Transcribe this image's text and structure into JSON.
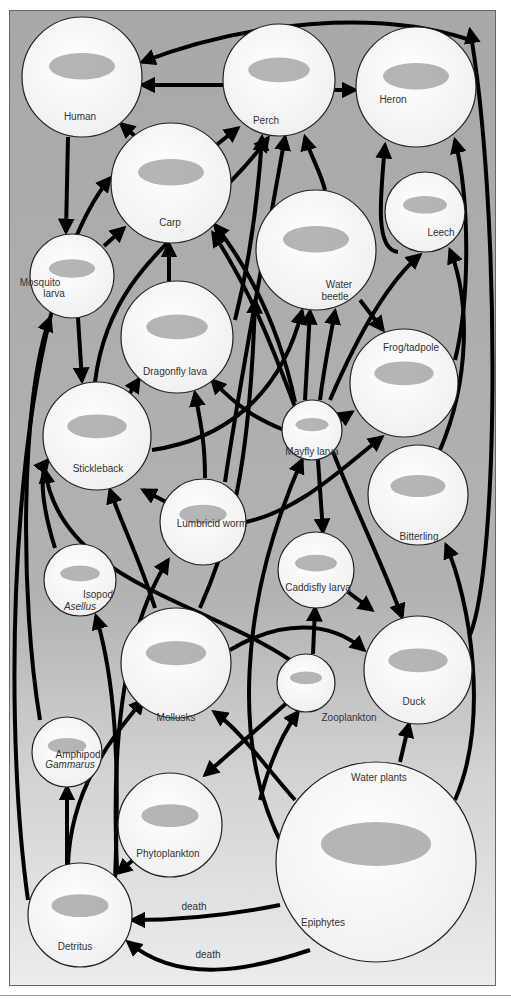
{
  "diagram": {
    "type": "food-web",
    "panel": {
      "x": 9,
      "y": 10,
      "w": 486,
      "h": 975,
      "color_top": "#a8a8a8",
      "color_bottom": "#ececec",
      "border": "#666666"
    },
    "nodes": [
      {
        "id": "human",
        "label": "Human",
        "cx": 82,
        "cy": 77,
        "r": 60,
        "lx": 80,
        "ly": 120
      },
      {
        "id": "perch",
        "label": "Perch",
        "cx": 279,
        "cy": 80,
        "r": 56,
        "lx": 266,
        "ly": 124
      },
      {
        "id": "heron",
        "label": "Heron",
        "cx": 416,
        "cy": 87,
        "r": 60,
        "lx": 393,
        "ly": 103
      },
      {
        "id": "carp",
        "label": "Carp",
        "cx": 171,
        "cy": 183,
        "r": 60,
        "lx": 170,
        "ly": 226
      },
      {
        "id": "leech",
        "label": "Leech",
        "cx": 425,
        "cy": 212,
        "r": 40,
        "lx": 441,
        "ly": 236
      },
      {
        "id": "water-beetle",
        "label": "Water",
        "label2": "beetle",
        "cx": 316,
        "cy": 250,
        "r": 60,
        "lx": 339,
        "ly": 288,
        "lx2": 335,
        "ly2": 300
      },
      {
        "id": "mosquito-larva",
        "label": "Mosquito",
        "label2": "larva",
        "cx": 72,
        "cy": 276,
        "r": 42,
        "lx": 40,
        "ly": 286,
        "lx2": 54,
        "ly2": 297
      },
      {
        "id": "dragonfly-larva",
        "label": "Dragonfly lava",
        "cx": 177,
        "cy": 337,
        "r": 56,
        "lx": 175,
        "ly": 375
      },
      {
        "id": "frog-tadpole",
        "label": "Frog/tadpole",
        "cx": 404,
        "cy": 383,
        "r": 54,
        "lx": 411,
        "ly": 351
      },
      {
        "id": "stickleback",
        "label": "Stickleback",
        "cx": 97,
        "cy": 436,
        "r": 54,
        "lx": 98,
        "ly": 472
      },
      {
        "id": "mayfly-larva",
        "label": "Mayfly larva",
        "cx": 312,
        "cy": 430,
        "r": 30,
        "lx": 312,
        "ly": 455
      },
      {
        "id": "lumbricid-worm",
        "label": "Lumbricid worm",
        "cx": 203,
        "cy": 522,
        "r": 43,
        "lx": 212,
        "ly": 527
      },
      {
        "id": "bitterling",
        "label": "Bitterling",
        "cx": 418,
        "cy": 495,
        "r": 50,
        "lx": 419,
        "ly": 540
      },
      {
        "id": "isopod-asellus",
        "label": "Isopod",
        "label2": "Asellus",
        "cx": 80,
        "cy": 580,
        "r": 36,
        "lx": 98,
        "ly": 598,
        "lx2": 80,
        "ly2": 610,
        "italic2": true
      },
      {
        "id": "caddisfly-larva",
        "label": "Caddisfly larva",
        "cx": 316,
        "cy": 570,
        "r": 38,
        "lx": 318,
        "ly": 591
      },
      {
        "id": "mollusks",
        "label": "Mollusks",
        "cx": 176,
        "cy": 663,
        "r": 55,
        "lx": 176,
        "ly": 721
      },
      {
        "id": "zooplankton",
        "label": "Zooplankton",
        "cx": 306,
        "cy": 683,
        "r": 29,
        "lx": 349,
        "ly": 721
      },
      {
        "id": "duck",
        "label": "Duck",
        "cx": 418,
        "cy": 670,
        "r": 54,
        "lx": 414,
        "ly": 705
      },
      {
        "id": "amphipod-gammarus",
        "label": "Amphipod",
        "label2": "Gammarus",
        "cx": 67,
        "cy": 752,
        "r": 35,
        "lx": 78,
        "ly": 758,
        "lx2": 70,
        "ly2": 768,
        "italic2": true
      },
      {
        "id": "phytoplankton",
        "label": "Phytoplankton",
        "cx": 170,
        "cy": 825,
        "r": 52,
        "lx": 168,
        "ly": 857
      },
      {
        "id": "water-plants",
        "label": "Water plants",
        "label2": "Epiphytes",
        "cx": 376,
        "cy": 862,
        "r": 100,
        "lx": 379,
        "ly": 781,
        "lx2": 323,
        "ly2": 926
      },
      {
        "id": "detritus",
        "label": "Detritus",
        "cx": 80,
        "cy": 915,
        "r": 52,
        "lx": 75,
        "ly": 950
      }
    ],
    "edges": [
      {
        "from": "perch",
        "to": "human",
        "d": "M223 85 L142 85"
      },
      {
        "from": "heron",
        "to": "human",
        "d": "M470 40 C380 10 250 20 142 62"
      },
      {
        "from": "carp",
        "to": "human",
        "d": "M135 136 L121 124"
      },
      {
        "from": "carp",
        "to": "perch",
        "d": "M215 146 L238 128"
      },
      {
        "from": "perch",
        "to": "heron",
        "d": "M333 90 L355 90"
      },
      {
        "from": "human",
        "to": "mosquito-larva",
        "d": "M68 137 L66 232"
      },
      {
        "from": "mosquito-larva",
        "to": "carp",
        "d": "M104 246 L124 228"
      },
      {
        "from": "mosquito-larva",
        "to": "stickleback",
        "d": "M78 318 L82 381"
      },
      {
        "from": "dragonfly-larva",
        "to": "carp",
        "d": "M169 281 L169 244"
      },
      {
        "from": "water-beetle",
        "to": "perch",
        "d": "M325 190 C320 170 310 155 305 137"
      },
      {
        "from": "dragonfly-larva",
        "to": "perch",
        "d": "M235 320 C250 260 258 200 262 137"
      },
      {
        "from": "stickleback",
        "to": "perch",
        "d": "M95 382 C110 260 200 230 268 138"
      },
      {
        "from": "leech",
        "to": "heron",
        "d": "M398 252 C375 250 380 200 385 145"
      },
      {
        "from": "frog-tadpole",
        "to": "heron",
        "d": "M455 360 C470 300 470 200 455 140"
      },
      {
        "from": "duck",
        "to": "heron",
        "d": "M470 635 C500 560 500 200 470 30"
      },
      {
        "from": "stickleback",
        "to": "dragonfly-larva",
        "d": "M130 393 L139 379"
      },
      {
        "from": "stickleback",
        "to": "water-beetle",
        "d": "M152 450 C220 440 280 400 302 311"
      },
      {
        "from": "mayfly-larva",
        "to": "frog-tadpole",
        "d": "M340 420 L352 412"
      },
      {
        "from": "mayfly-larva",
        "to": "water-beetle",
        "d": "M305 400 L310 311"
      },
      {
        "from": "mayfly-larva",
        "to": "water-beetle-2",
        "d": "M320 400 C325 360 330 340 335 311"
      },
      {
        "from": "mayfly-larva",
        "to": "dragonfly-larva",
        "d": "M284 430 C260 420 240 410 212 380"
      },
      {
        "from": "mayfly-larva",
        "to": "carp",
        "d": "M295 402 C280 330 250 270 215 225"
      },
      {
        "from": "mayfly-larva",
        "to": "leech",
        "d": "M330 400 C360 330 390 280 420 255"
      },
      {
        "from": "water-beetle",
        "to": "frog-tadpole",
        "d": "M360 300 L383 330"
      },
      {
        "from": "lumbricid-worm",
        "to": "stickleback",
        "d": "M168 503 L143 490"
      },
      {
        "from": "lumbricid-worm",
        "to": "dragonfly-larva",
        "d": "M205 478 C205 440 200 420 195 393"
      },
      {
        "from": "lumbricid-worm",
        "to": "frog-tadpole",
        "d": "M246 522 C300 510 340 470 382 437"
      },
      {
        "from": "lumbricid-worm",
        "to": "perch-2",
        "d": "M225 482 C240 380 265 250 285 137"
      },
      {
        "from": "mayfly-larva",
        "to": "caddisfly-larva",
        "d": "M318 460 L323 532"
      },
      {
        "from": "mayfly-larva",
        "to": "duck",
        "d": "M333 452 C360 520 385 570 402 617"
      },
      {
        "from": "bitterling",
        "to": "leech",
        "d": "M440 450 C470 380 470 300 450 250"
      },
      {
        "from": "isopod-asellus",
        "to": "stickleback",
        "d": "M55 548 C40 500 40 470 48 460"
      },
      {
        "from": "mollusks",
        "to": "stickleback",
        "d": "M155 608 C140 560 120 520 110 490"
      },
      {
        "from": "zooplankton",
        "to": "stickleback-2",
        "d": "M290 660 C200 600 60 580 45 470"
      },
      {
        "from": "caddisfly-larva",
        "to": "duck",
        "d": "M348 592 L372 610"
      },
      {
        "from": "mollusks",
        "to": "duck",
        "d": "M230 650 C280 620 330 620 364 650"
      },
      {
        "from": "mollusks",
        "to": "lumbricid-worm-2",
        "d": "M200 608 C230 540 250 470 255 300"
      },
      {
        "from": "zooplankton",
        "to": "caddisfly-larva",
        "d": "M313 654 L315 608"
      },
      {
        "from": "water-plants",
        "to": "duck",
        "d": "M400 762 L409 724"
      },
      {
        "from": "water-plants",
        "to": "bitterling",
        "d": "M455 800 C490 720 470 600 446 545"
      },
      {
        "from": "water-plants",
        "to": "mollusks",
        "d": "M295 800 C260 760 240 730 214 712"
      },
      {
        "from": "water-plants",
        "to": "zooplankton",
        "d": "M260 800 C270 760 285 730 298 712"
      },
      {
        "from": "water-plants",
        "to": "mayfly-larva",
        "d": "M285 850 C230 750 240 600 302 460"
      },
      {
        "from": "zooplankton",
        "to": "phytoplankton",
        "d": "M290 700 L205 775"
      },
      {
        "from": "detritus",
        "to": "amphipod-gammarus",
        "d": "M67 866 L67 787"
      },
      {
        "from": "detritus",
        "to": "mollusks",
        "d": "M68 866 C70 790 110 740 143 700"
      },
      {
        "from": "detritus",
        "to": "isopod-asellus",
        "d": "M115 880 C120 760 115 680 96 616"
      },
      {
        "from": "detritus",
        "to": "lumbricid-worm",
        "d": "M117 870 C110 720 130 620 168 560"
      },
      {
        "from": "amphipod-gammarus",
        "to": "mosquito-larva",
        "d": "M40 720 C20 600 20 400 50 318"
      },
      {
        "from": "detritus",
        "to": "carp",
        "d": "M28 900 C0 700 10 300 110 178"
      },
      {
        "from": "phytoplankton",
        "to": "detritus",
        "d": "M133 860 L118 873"
      },
      {
        "from": "water-plants",
        "to": "detritus",
        "label_key": "death_1",
        "d": "M280 905 C230 915 180 920 132 920"
      },
      {
        "from": "water-plants",
        "to": "detritus",
        "label_key": "death_2",
        "d": "M310 950 C250 970 180 985 128 942"
      },
      {
        "from": "mayfly-larva-crossing",
        "to": "carp-2",
        "d": "M300 420 C270 340 250 290 213 233"
      }
    ],
    "edge_labels": {
      "death_1": {
        "text": "death",
        "x": 194,
        "y": 910
      },
      "death_2": {
        "text": "death",
        "x": 208,
        "y": 958
      }
    }
  }
}
